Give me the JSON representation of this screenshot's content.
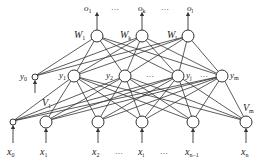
{
  "diagram": {
    "type": "neural-network",
    "layers": {
      "output": {
        "labels": [
          "o",
          "…",
          "o",
          "…",
          "o"
        ],
        "subs": [
          "1",
          "",
          "k",
          "",
          "l"
        ],
        "weights": [
          {
            "label": "W",
            "sub": "1"
          },
          {
            "label": "W",
            "sub": "k"
          },
          {
            "label": "W",
            "sub": "l"
          }
        ]
      },
      "hidden": {
        "bias": {
          "label": "y",
          "sub": "0"
        },
        "nodes": [
          {
            "label": "y",
            "sub": "1"
          },
          {
            "label": "y",
            "sub": "2"
          },
          {
            "label": "y",
            "sub": "j"
          },
          {
            "label": "y",
            "sub": "m"
          }
        ],
        "ellipses": [
          "…",
          "…"
        ]
      },
      "input": {
        "nodes": [
          {
            "label": "x",
            "sub": "0"
          },
          {
            "label": "x",
            "sub": "1"
          },
          {
            "label": "x",
            "sub": "2"
          },
          {
            "label": "x",
            "sub": "i"
          },
          {
            "label": "x",
            "sub": "n−1"
          },
          {
            "label": "x",
            "sub": "n"
          }
        ],
        "ellipses": [
          "…",
          "…"
        ],
        "weights": [
          {
            "label": "V",
            "sub": "1"
          },
          {
            "label": "V",
            "sub": "m"
          }
        ]
      }
    }
  }
}
